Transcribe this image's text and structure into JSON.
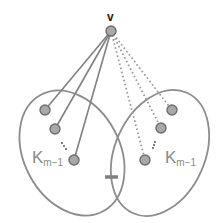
{
  "diagram": {
    "title": "",
    "apex_vertex": {
      "label": "v",
      "x": 111,
      "y": 31
    },
    "left_clique": {
      "label_main": "K",
      "label_sub": "m−1",
      "nodes": [
        {
          "x": 45,
          "y": 110
        },
        {
          "x": 55,
          "y": 129
        },
        {
          "x": 74,
          "y": 160
        }
      ],
      "edge_style": "solid"
    },
    "right_clique": {
      "label_main": "K",
      "label_sub": "m−1",
      "nodes": [
        {
          "x": 172,
          "y": 110
        },
        {
          "x": 161,
          "y": 128
        },
        {
          "x": 145,
          "y": 160
        }
      ],
      "edge_style": "dotted"
    },
    "bridge": {
      "label": "",
      "from_x": 105,
      "to_x": 118,
      "y": 177
    },
    "ellipsis": "⋮",
    "colors": {
      "line": "#808080",
      "node_fill": "#a8a8a8",
      "node_stroke": "#6e6e6e",
      "dotted": "#9a9a9a",
      "label": "#8a8a8a"
    }
  }
}
